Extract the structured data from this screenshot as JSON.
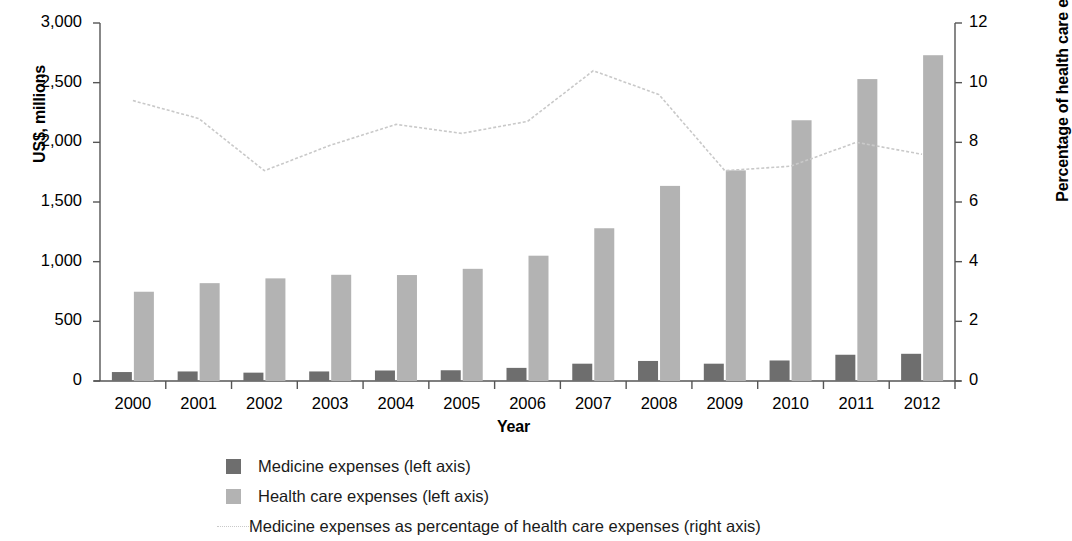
{
  "chart_data": {
    "type": "bar",
    "title": "",
    "xlabel": "Year",
    "ylabel": "US$, millions",
    "ylabel_right": "Percentage of health care expenses",
    "categories": [
      "2000",
      "2001",
      "2002",
      "2003",
      "2004",
      "2005",
      "2006",
      "2007",
      "2008",
      "2009",
      "2010",
      "2011",
      "2012"
    ],
    "ylim": [
      0,
      3000
    ],
    "yticks": [
      "0",
      "500",
      "1,000",
      "1,500",
      "2,000",
      "2,500",
      "3,000"
    ],
    "ytick_values": [
      0,
      500,
      1000,
      1500,
      2000,
      2500,
      3000
    ],
    "ylim_right": [
      0,
      12
    ],
    "yticks_right": [
      "0",
      "2",
      "4",
      "6",
      "8",
      "10",
      "12"
    ],
    "ytick_values_right": [
      0,
      2,
      4,
      6,
      8,
      10,
      12
    ],
    "grid": false,
    "legend_position": "bottom",
    "series": [
      {
        "name": "Medicine expenses (left axis)",
        "axis": "left",
        "kind": "bar",
        "color": "#6e6e6e",
        "values": [
          75,
          80,
          70,
          80,
          88,
          90,
          110,
          145,
          168,
          145,
          172,
          220,
          228
        ]
      },
      {
        "name": "Health care expenses (left axis)",
        "axis": "left",
        "kind": "bar",
        "color": "#b3b3b3",
        "values": [
          748,
          820,
          860,
          890,
          888,
          940,
          1050,
          1280,
          1635,
          1765,
          2185,
          2530,
          2730
        ]
      },
      {
        "name": "Medicine expenses as percentage of health care expenses (right axis)",
        "axis": "right",
        "kind": "line",
        "color": "#c9c9c9",
        "values": [
          9.4,
          8.8,
          7.05,
          7.9,
          8.6,
          8.3,
          8.7,
          10.4,
          9.6,
          7.05,
          7.2,
          8.0,
          7.6
        ]
      }
    ]
  },
  "legend": {
    "items": [
      {
        "label": "Medicine expenses (left axis)",
        "marker": "square-dark"
      },
      {
        "label": "Health care expenses (left axis)",
        "marker": "square-light"
      },
      {
        "label": "Medicine expenses as percentage of health care expenses (right axis)",
        "marker": "dotted-line"
      }
    ]
  }
}
